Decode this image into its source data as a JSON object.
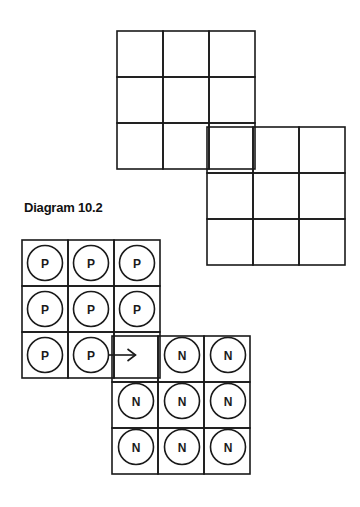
{
  "caption": "Diagram 10.2",
  "colors": {
    "line": "#1a1a1a",
    "background": "#ffffff"
  },
  "top_figure": {
    "description": "empty grid of two overlapping 3x3 blocks",
    "blocks": [
      {
        "x": 117,
        "y": 31,
        "rows": 3,
        "cols": 3,
        "cell": 46
      },
      {
        "x": 207,
        "y": 127,
        "rows": 3,
        "cols": 3,
        "cell": 46
      }
    ]
  },
  "bottom_figure": {
    "blocks": [
      {
        "x": 22,
        "y": 240,
        "rows": 3,
        "cols": 3,
        "cell": 46
      },
      {
        "x": 112,
        "y": 336,
        "rows": 3,
        "cols": 3,
        "cell": 46
      }
    ],
    "pieces": [
      {
        "label": "P",
        "row": 0,
        "col": 0
      },
      {
        "label": "P",
        "row": 0,
        "col": 1
      },
      {
        "label": "P",
        "row": 0,
        "col": 2
      },
      {
        "label": "P",
        "row": 1,
        "col": 0
      },
      {
        "label": "P",
        "row": 1,
        "col": 1
      },
      {
        "label": "P",
        "row": 1,
        "col": 2
      },
      {
        "label": "P",
        "row": 2,
        "col": 0
      },
      {
        "label": "P",
        "row": 2,
        "col": 1
      },
      {
        "label": "N",
        "row": 2,
        "col": 3
      },
      {
        "label": "N",
        "row": 2,
        "col": 4
      },
      {
        "label": "N",
        "row": 3,
        "col": 2
      },
      {
        "label": "N",
        "row": 3,
        "col": 3
      },
      {
        "label": "N",
        "row": 3,
        "col": 4
      },
      {
        "label": "N",
        "row": 4,
        "col": 2
      },
      {
        "label": "N",
        "row": 4,
        "col": 3
      },
      {
        "label": "N",
        "row": 4,
        "col": 4
      }
    ],
    "arrow": {
      "from_row": 2,
      "from_col": 1,
      "to_row": 2,
      "to_col": 2,
      "direction": "right"
    }
  }
}
